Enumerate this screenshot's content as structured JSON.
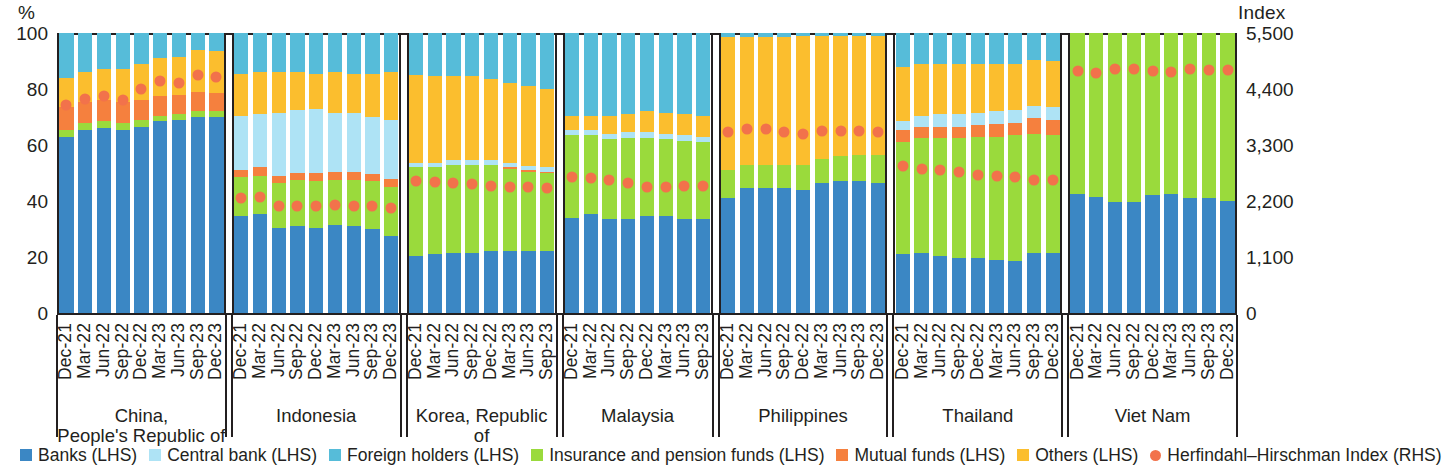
{
  "axes": {
    "left_unit": "%",
    "right_unit": "Index",
    "left_ticks": [
      "100",
      "80",
      "60",
      "40",
      "20",
      "0"
    ],
    "right_ticks": [
      "5,500",
      "4,400",
      "3,300",
      "2,200",
      "1,100",
      "0"
    ]
  },
  "legend": [
    {
      "label": "Banks (LHS)",
      "color": "#3b87c4",
      "shape": "square"
    },
    {
      "label": "Central bank (LHS)",
      "color": "#aee3f5",
      "shape": "square"
    },
    {
      "label": "Foreign holders (LHS)",
      "color": "#56bcd9",
      "shape": "square"
    },
    {
      "label": "Insurance and pension funds (LHS)",
      "color": "#9ada3c",
      "shape": "square"
    },
    {
      "label": "Mutual funds (LHS)",
      "color": "#f5803e",
      "shape": "square"
    },
    {
      "label": "Others (LHS)",
      "color": "#fbbe2e",
      "shape": "square"
    },
    {
      "label": "Herfindahl–Hirschman Index (RHS)",
      "color": "#f2724b",
      "shape": "circle"
    }
  ],
  "chart_data": {
    "type": "bar",
    "subtype": "stacked-bar-with-overlay-scatter",
    "title": "",
    "xlabel": "",
    "ylabel": "%",
    "ylabel_right": "Index",
    "ylim": [
      0,
      100
    ],
    "ylim_right": [
      0,
      5500
    ],
    "ytick_step": 20,
    "ytick_step_right": 1100,
    "grid": false,
    "legend_position": "bottom",
    "series_order": [
      "Banks (LHS)",
      "Insurance and pension funds (LHS)",
      "Mutual funds (LHS)",
      "Central bank (LHS)",
      "Others (LHS)",
      "Foreign holders (LHS)"
    ],
    "series_colors": {
      "Banks (LHS)": "#3b87c4",
      "Central bank (LHS)": "#aee3f5",
      "Foreign holders (LHS)": "#56bcd9",
      "Insurance and pension funds (LHS)": "#9ada3c",
      "Mutual funds (LHS)": "#f5803e",
      "Others (LHS)": "#fbbe2e",
      "Herfindahl–Hirschman Index (RHS)": "#f2724b"
    },
    "panels": [
      {
        "name": "China, People's Republic of",
        "name_lines": [
          "China,",
          "People's Republic of"
        ],
        "categories": [
          "Dec-21",
          "Mar-22",
          "Jun-22",
          "Sep-22",
          "Dec-22",
          "Mar-23",
          "Jun-23",
          "Sep-23",
          "Dec-23"
        ],
        "stacks": {
          "Banks (LHS)": [
            63.0,
            65.5,
            66.0,
            65.5,
            66.5,
            68.5,
            69.0,
            70.0,
            70.0
          ],
          "Insurance and pension funds (LHS)": [
            2.5,
            2.5,
            2.5,
            2.5,
            2.5,
            2.0,
            2.0,
            2.0,
            2.0
          ],
          "Mutual funds (LHS)": [
            8.0,
            7.5,
            7.5,
            7.5,
            7.0,
            7.0,
            7.0,
            7.0,
            6.5
          ],
          "Central bank (LHS)": [
            0.0,
            0.0,
            0.0,
            0.0,
            0.0,
            0.0,
            0.0,
            0.0,
            0.0
          ],
          "Others (LHS)": [
            10.5,
            10.5,
            11.0,
            11.5,
            13.0,
            13.5,
            13.5,
            15.0,
            15.0
          ],
          "Foreign holders (LHS)": [
            16.0,
            14.0,
            13.0,
            13.0,
            11.0,
            9.0,
            8.5,
            6.0,
            6.5
          ]
        },
        "hhi": [
          4080,
          4200,
          4270,
          4190,
          4400,
          4550,
          4510,
          4680,
          4640
        ]
      },
      {
        "name": "Indonesia",
        "name_lines": [
          "Indonesia"
        ],
        "categories": [
          "Dec-21",
          "Mar-22",
          "Jun-22",
          "Sep-22",
          "Dec-22",
          "Mar-23",
          "Jun-23",
          "Sep-23",
          "Dec-23"
        ],
        "stacks": {
          "Banks (LHS)": [
            34.5,
            35.5,
            30.5,
            31.0,
            30.5,
            31.5,
            31.0,
            30.0,
            27.5
          ],
          "Insurance and pension funds (LHS)": [
            14.0,
            13.5,
            16.0,
            16.5,
            16.5,
            16.0,
            16.5,
            17.0,
            17.5
          ],
          "Mutual funds (LHS)": [
            2.5,
            3.0,
            2.5,
            2.5,
            3.0,
            3.0,
            3.0,
            2.5,
            3.0
          ],
          "Central bank (LHS)": [
            19.5,
            19.0,
            22.5,
            22.5,
            23.0,
            21.0,
            21.0,
            20.5,
            21.0
          ],
          "Others (LHS)": [
            15.0,
            15.0,
            14.5,
            13.5,
            12.5,
            14.5,
            14.0,
            15.5,
            17.0
          ],
          "Foreign holders (LHS)": [
            14.5,
            14.0,
            14.0,
            14.0,
            14.5,
            14.0,
            14.5,
            14.5,
            14.0
          ]
        },
        "hhi": [
          2250,
          2280,
          2100,
          2100,
          2110,
          2120,
          2100,
          2110,
          2060
        ]
      },
      {
        "name": "Korea, Republic of",
        "name_lines": [
          "Korea, Republic of"
        ],
        "categories": [
          "Dec-21",
          "Mar-22",
          "Jun-22",
          "Sep-22",
          "Dec-22",
          "Mar-23",
          "Jun-23",
          "Sep-23"
        ],
        "stacks": {
          "Banks (LHS)": [
            20.5,
            21.0,
            21.5,
            21.5,
            22.0,
            22.0,
            22.0,
            22.0
          ],
          "Insurance and pension funds (LHS)": [
            31.5,
            31.0,
            31.5,
            31.5,
            31.0,
            29.5,
            28.5,
            28.0
          ],
          "Mutual funds (LHS)": [
            0.0,
            0.0,
            0.0,
            0.0,
            0.0,
            0.5,
            0.5,
            0.5
          ],
          "Central bank (LHS)": [
            1.5,
            1.5,
            1.5,
            1.5,
            1.5,
            1.5,
            1.5,
            1.5
          ],
          "Others (LHS)": [
            31.5,
            31.0,
            30.0,
            30.0,
            29.0,
            28.5,
            28.5,
            28.0
          ],
          "Foreign holders (LHS)": [
            15.0,
            15.5,
            15.5,
            15.5,
            16.5,
            18.0,
            19.0,
            20.0
          ]
        },
        "hhi": [
          2600,
          2580,
          2560,
          2530,
          2500,
          2480,
          2470,
          2460
        ]
      },
      {
        "name": "Malaysia",
        "name_lines": [
          "Malaysia"
        ],
        "categories": [
          "Dec-21",
          "Mar-22",
          "Jun-22",
          "Sep-22",
          "Dec-22",
          "Mar-23",
          "Jun-23",
          "Sep-23"
        ],
        "stacks": {
          "Banks (LHS)": [
            34.0,
            35.5,
            33.5,
            33.5,
            34.5,
            34.5,
            33.5,
            33.5
          ],
          "Insurance and pension funds (LHS)": [
            29.5,
            28.0,
            28.5,
            29.0,
            28.0,
            27.5,
            28.0,
            27.5
          ],
          "Mutual funds (LHS)": [
            0.0,
            0.0,
            0.0,
            0.0,
            0.0,
            0.0,
            0.0,
            0.0
          ],
          "Central bank (LHS)": [
            2.0,
            2.0,
            2.0,
            2.0,
            2.0,
            2.0,
            2.0,
            2.0
          ],
          "Others (LHS)": [
            5.0,
            5.0,
            6.5,
            6.5,
            7.5,
            7.5,
            7.5,
            7.5
          ],
          "Foreign holders (LHS)": [
            29.5,
            29.5,
            29.5,
            29.0,
            28.0,
            28.5,
            29.0,
            29.5
          ]
        },
        "hhi": [
          2670,
          2660,
          2610,
          2560,
          2480,
          2470,
          2490,
          2500
        ]
      },
      {
        "name": "Philippines",
        "name_lines": [
          "Philippines"
        ],
        "categories": [
          "Dec-21",
          "Mar-22",
          "Jun-22",
          "Sep-22",
          "Dec-22",
          "Mar-23",
          "Jun-23",
          "Sep-23",
          "Dec-23"
        ],
        "stacks": {
          "Banks (LHS)": [
            41.0,
            44.5,
            44.5,
            44.5,
            44.0,
            46.5,
            47.0,
            47.0,
            46.5
          ],
          "Insurance and pension funds (LHS)": [
            10.0,
            8.5,
            8.5,
            8.5,
            9.0,
            8.5,
            9.0,
            9.5,
            10.0
          ],
          "Mutual funds (LHS)": [
            0.0,
            0.0,
            0.0,
            0.0,
            0.0,
            0.0,
            0.0,
            0.0,
            0.0
          ],
          "Central bank (LHS)": [
            0.0,
            0.0,
            0.0,
            0.0,
            0.0,
            0.0,
            0.0,
            0.0,
            0.0
          ],
          "Others (LHS)": [
            47.5,
            45.5,
            45.5,
            45.5,
            46.0,
            44.0,
            43.0,
            42.5,
            42.5
          ],
          "Foreign holders (LHS)": [
            1.5,
            1.5,
            1.5,
            1.5,
            1.0,
            1.0,
            1.0,
            1.0,
            1.0
          ]
        },
        "hhi": [
          3560,
          3620,
          3620,
          3560,
          3520,
          3580,
          3580,
          3580,
          3560
        ]
      },
      {
        "name": "Thailand",
        "name_lines": [
          "Thailand"
        ],
        "categories": [
          "Dec-21",
          "Mar-22",
          "Jun-22",
          "Sep-22",
          "Dec-22",
          "Mar-23",
          "Jun-23",
          "Sep-23",
          "Dec-23"
        ],
        "stacks": {
          "Banks (LHS)": [
            21.0,
            21.5,
            20.5,
            19.5,
            19.5,
            19.0,
            18.5,
            21.5,
            21.5
          ],
          "Insurance and pension funds (LHS)": [
            40.0,
            41.0,
            42.0,
            43.0,
            43.5,
            44.0,
            45.0,
            42.5,
            42.0
          ],
          "Mutual funds (LHS)": [
            4.5,
            4.0,
            4.0,
            4.0,
            4.0,
            4.5,
            4.5,
            5.5,
            5.5
          ],
          "Central bank (LHS)": [
            3.0,
            4.0,
            4.5,
            4.5,
            4.5,
            4.5,
            4.5,
            4.5,
            4.5
          ],
          "Others (LHS)": [
            19.5,
            18.5,
            18.0,
            18.0,
            17.5,
            17.0,
            16.5,
            16.5,
            16.5
          ],
          "Foreign holders (LHS)": [
            12.0,
            11.0,
            11.0,
            11.0,
            11.0,
            11.0,
            11.0,
            9.5,
            10.0
          ]
        },
        "hhi": [
          2880,
          2820,
          2800,
          2770,
          2720,
          2700,
          2670,
          2620,
          2620
        ]
      },
      {
        "name": "Viet Nam",
        "name_lines": [
          "Viet Nam"
        ],
        "categories": [
          "Dec-21",
          "Mar-22",
          "Jun-22",
          "Sep-22",
          "Dec-22",
          "Mar-23",
          "Jun-23",
          "Sep-23",
          "Dec-23"
        ],
        "stacks": {
          "Banks (LHS)": [
            42.5,
            41.5,
            39.5,
            39.5,
            42.0,
            42.5,
            41.0,
            41.0,
            40.0
          ],
          "Insurance and pension funds (LHS)": [
            57.5,
            58.5,
            60.5,
            60.5,
            58.0,
            57.5,
            59.0,
            59.0,
            60.0
          ],
          "Mutual funds (LHS)": [
            0.0,
            0.0,
            0.0,
            0.0,
            0.0,
            0.0,
            0.0,
            0.0,
            0.0
          ],
          "Central bank (LHS)": [
            0.0,
            0.0,
            0.0,
            0.0,
            0.0,
            0.0,
            0.0,
            0.0,
            0.0
          ],
          "Others (LHS)": [
            0.0,
            0.0,
            0.0,
            0.0,
            0.0,
            0.0,
            0.0,
            0.0,
            0.0
          ],
          "Foreign holders (LHS)": [
            0.0,
            0.0,
            0.0,
            0.0,
            0.0,
            0.0,
            0.0,
            0.0,
            0.0
          ]
        },
        "hhi": [
          4750,
          4720,
          4800,
          4790,
          4760,
          4740,
          4790,
          4780,
          4780
        ]
      }
    ]
  }
}
